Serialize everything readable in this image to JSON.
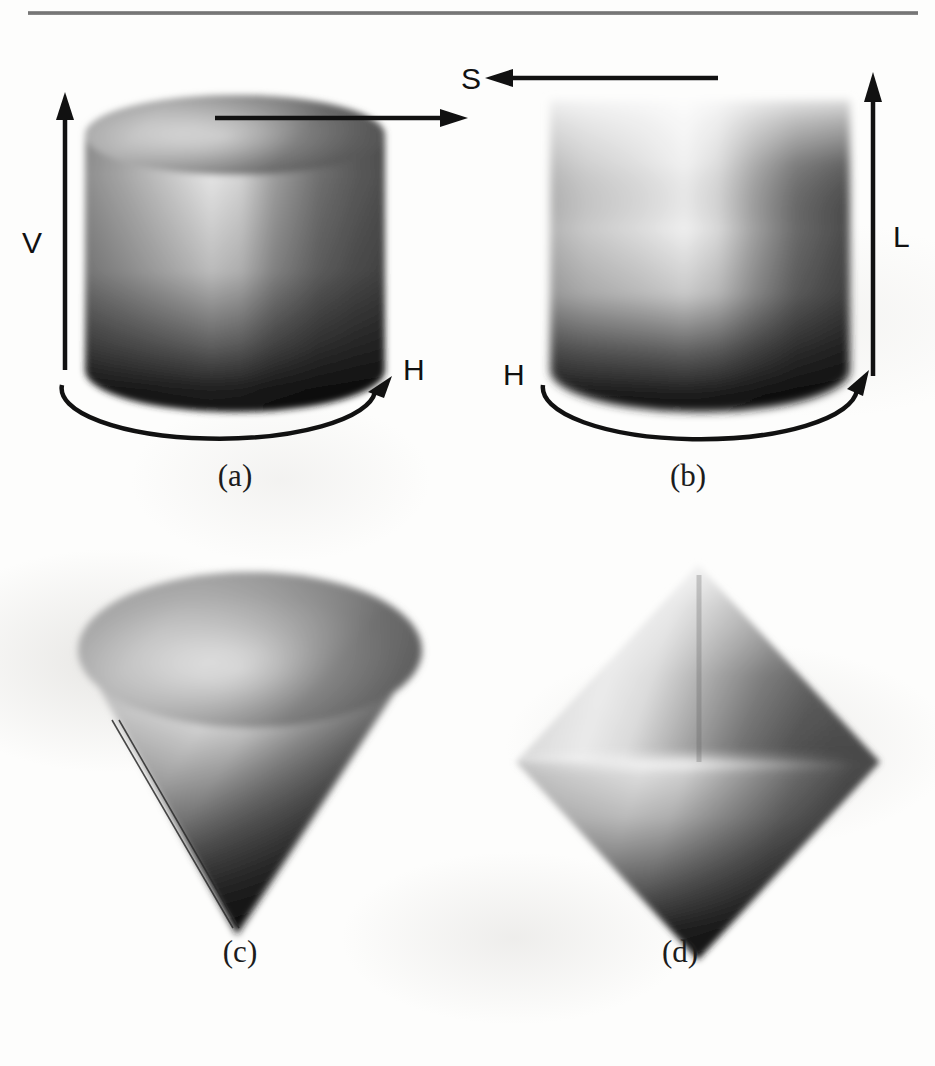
{
  "figure": {
    "type": "color-space-solids-figure",
    "rule_present": true
  },
  "panels": [
    {
      "id": "a",
      "caption": "(a)",
      "shape": "cylinder",
      "model": "HSV",
      "labels": {
        "vertical_axis": "V",
        "radial_axis": "S",
        "angular_axis": "H"
      },
      "axis_directions": {
        "vertical_axis": "up",
        "radial_axis": "right",
        "angular_axis": "curved-around-base"
      }
    },
    {
      "id": "b",
      "caption": "(b)",
      "shape": "cylinder",
      "model": "HSL",
      "labels": {
        "vertical_axis": "L",
        "radial_axis": "S",
        "angular_axis": "H"
      },
      "axis_directions": {
        "vertical_axis": "up",
        "radial_axis": "left",
        "angular_axis": "curved-around-base"
      }
    },
    {
      "id": "c",
      "caption": "(c)",
      "shape": "cone",
      "model": "HSV",
      "labels": {},
      "axis_directions": {}
    },
    {
      "id": "d",
      "caption": "(d)",
      "shape": "bicone",
      "model": "HSL",
      "labels": {},
      "axis_directions": {}
    }
  ],
  "shared_labels": {
    "saturation": "S",
    "value": "V",
    "lightness": "L",
    "hue": "H"
  },
  "colors": {
    "rule": "#6d6d6d",
    "ink": "#111111",
    "paper": "#fdfdfc",
    "solid_light": "#e8e8e8",
    "solid_mid": "#9a9a9a",
    "solid_dark": "#1a1a1a"
  }
}
